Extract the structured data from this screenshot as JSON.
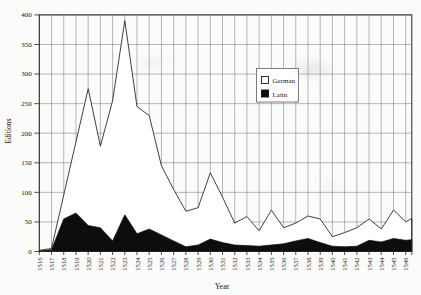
{
  "figure": {
    "background": "#fbfbf9",
    "ink": "#161616",
    "grid_color": "#7d7d7d",
    "frame_color": "#262626",
    "area_outline": "#1f1f1f",
    "german_fill": "#ffffff",
    "latin_fill": "#0d0d0d"
  },
  "chart_data": {
    "type": "area",
    "title": "",
    "xlabel": "Year",
    "ylabel": "Editions",
    "x": [
      1516,
      1517,
      1518,
      1519,
      1520,
      1521,
      1522,
      1523,
      1524,
      1525,
      1526,
      1527,
      1528,
      1529,
      1530,
      1531,
      1532,
      1533,
      1534,
      1535,
      1536,
      1537,
      1538,
      1539,
      1540,
      1541,
      1542,
      1543,
      1544,
      1545,
      1546
    ],
    "series": [
      {
        "name": "German",
        "values": [
          2,
          5,
          95,
          185,
          275,
          178,
          255,
          390,
          245,
          230,
          145,
          105,
          68,
          74,
          133,
          92,
          48,
          59,
          35,
          70,
          40,
          48,
          60,
          55,
          25,
          32,
          40,
          55,
          38,
          70,
          50
        ]
      },
      {
        "name": "Latin",
        "values": [
          1,
          3,
          55,
          65,
          44,
          40,
          18,
          62,
          30,
          38,
          28,
          18,
          8,
          11,
          21,
          15,
          11,
          10,
          9,
          11,
          13,
          18,
          22,
          15,
          9,
          8,
          9,
          19,
          16,
          22,
          19
        ]
      }
    ],
    "right_edge_values": [
      56,
      20
    ],
    "ylim": [
      0,
      400
    ],
    "ytick_step": 50,
    "grid": true,
    "legend": {
      "entries": [
        "German",
        "Latin"
      ],
      "position": "inside-upper-center-right"
    }
  }
}
